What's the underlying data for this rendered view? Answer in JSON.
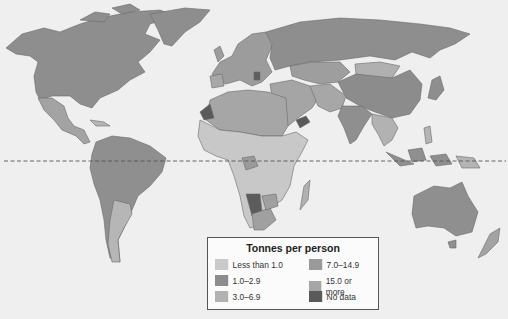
{
  "map": {
    "type": "choropleth-world-map",
    "equator_line": "dashed",
    "colors": {
      "ocean": "#efefef",
      "less_than_1": "#c9c9c9",
      "1_to_2_9": "#8c8c8c",
      "3_to_6_9": "#b2b2b2",
      "7_to_14_9": "#9a9a9a",
      "15_or_more": "#a6a6a6",
      "no_data": "#5a5a5a"
    }
  },
  "legend": {
    "title": "Tonnes per person",
    "items": [
      {
        "label": "Less than 1.0",
        "color": "#c9c9c9"
      },
      {
        "label": "1.0–2.9",
        "color": "#8c8c8c"
      },
      {
        "label": "3.0–6.9",
        "color": "#b2b2b2"
      },
      {
        "label": "7.0–14.9",
        "color": "#9a9a9a"
      },
      {
        "label": "15.0 or more",
        "color": "#a6a6a6"
      },
      {
        "label": "No data",
        "color": "#5a5a5a"
      }
    ]
  }
}
